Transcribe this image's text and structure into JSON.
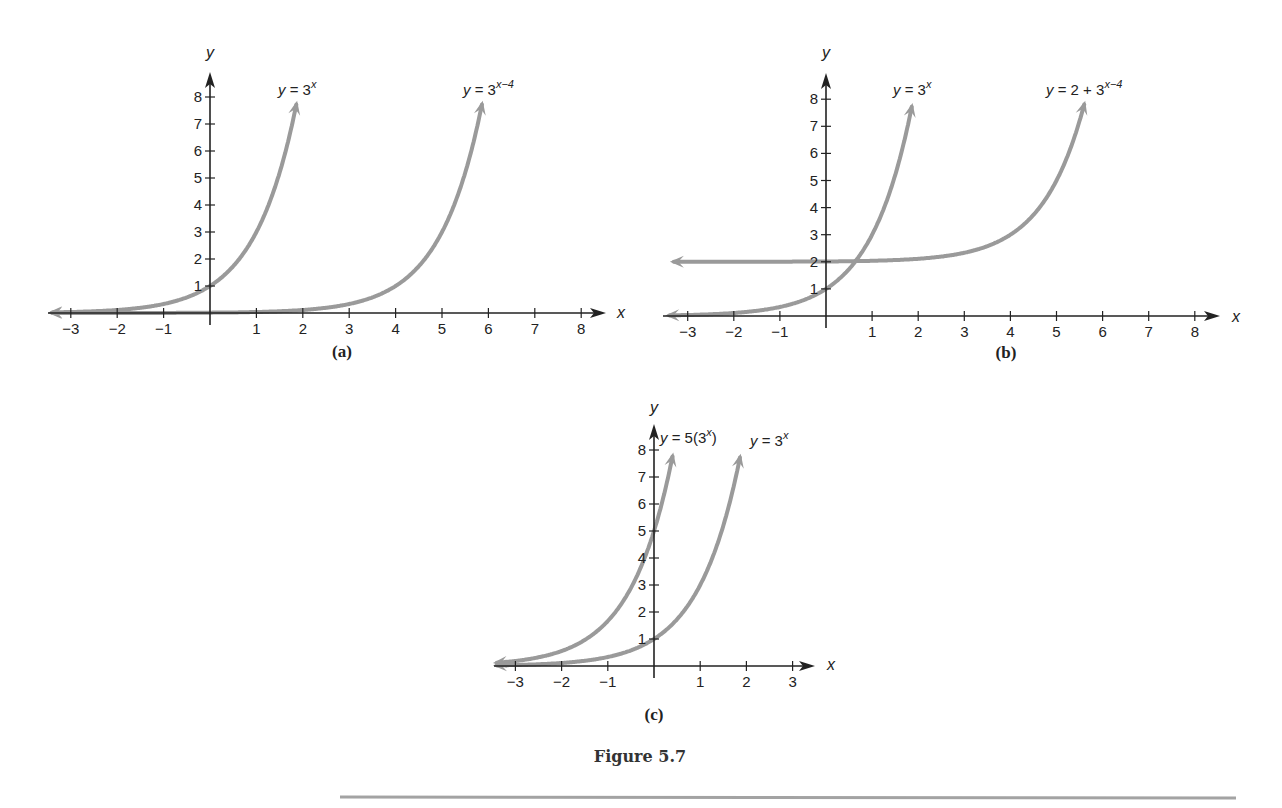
{
  "figure": {
    "caption": "Figure 5.7",
    "curve_color": "#9a9a9a",
    "axis_color": "#222222",
    "divider_color": "#a3a3a3"
  },
  "chart_data": [
    {
      "type": "line",
      "panel_label": "(a)",
      "xlabel": "x",
      "ylabel": "y",
      "xlim": [
        -3,
        8
      ],
      "ylim": [
        0,
        8
      ],
      "x_ticks": [
        -3,
        -2,
        -1,
        1,
        2,
        3,
        4,
        5,
        6,
        7,
        8
      ],
      "y_ticks": [
        1,
        2,
        3,
        4,
        5,
        6,
        7,
        8
      ],
      "grid": false,
      "series": [
        {
          "name": "y = 3^x",
          "label": "y = 3",
          "label_sup": "x",
          "x": [
            -3,
            -2,
            -1,
            0,
            1,
            1.87
          ],
          "y": [
            0.04,
            0.11,
            0.33,
            1,
            3,
            7.8
          ]
        },
        {
          "name": "y = 3^(x-4)",
          "label": "y = 3",
          "label_sup": "x−4",
          "x": [
            -3,
            0,
            2,
            3,
            4,
            5,
            5.87
          ],
          "y": [
            0.0005,
            0.012,
            0.11,
            0.33,
            1,
            3,
            7.8
          ]
        }
      ]
    },
    {
      "type": "line",
      "panel_label": "(b)",
      "xlabel": "x",
      "ylabel": "y",
      "xlim": [
        -3,
        8
      ],
      "ylim": [
        0,
        8
      ],
      "x_ticks": [
        -3,
        -2,
        -1,
        1,
        2,
        3,
        4,
        5,
        6,
        7,
        8
      ],
      "y_ticks": [
        1,
        2,
        3,
        4,
        5,
        6,
        7,
        8
      ],
      "grid": false,
      "series": [
        {
          "name": "y = 3^x",
          "label": "y = 3",
          "label_sup": "x",
          "x": [
            -3,
            -2,
            -1,
            0,
            1,
            1.87
          ],
          "y": [
            0.04,
            0.11,
            0.33,
            1,
            3,
            7.8
          ]
        },
        {
          "name": "y = 2 + 3^(x-4)",
          "label": "y = 2 + 3",
          "label_sup": "x−4",
          "x": [
            -3.2,
            0,
            2,
            3,
            4,
            5,
            5.6
          ],
          "y": [
            2.0,
            2.01,
            2.11,
            2.33,
            3,
            5,
            7.8
          ]
        }
      ]
    },
    {
      "type": "line",
      "panel_label": "(c)",
      "xlabel": "x",
      "ylabel": "y",
      "xlim": [
        -3,
        3
      ],
      "ylim": [
        0,
        8
      ],
      "x_ticks": [
        -3,
        -2,
        -1,
        1,
        2,
        3
      ],
      "y_ticks": [
        1,
        2,
        3,
        4,
        5,
        6,
        7,
        8
      ],
      "grid": false,
      "series": [
        {
          "name": "y = 5(3^x)",
          "label": "y = 5(3",
          "label_sup": "x",
          "label_tail": ")",
          "x": [
            -3,
            -2,
            -1,
            0,
            0.4
          ],
          "y": [
            0.19,
            0.56,
            1.67,
            5,
            7.8
          ]
        },
        {
          "name": "y = 3^x",
          "label": "y = 3",
          "label_sup": "x",
          "x": [
            -3,
            -2,
            -1,
            0,
            1,
            1.87
          ],
          "y": [
            0.04,
            0.11,
            0.33,
            1,
            3,
            7.8
          ]
        }
      ]
    }
  ]
}
